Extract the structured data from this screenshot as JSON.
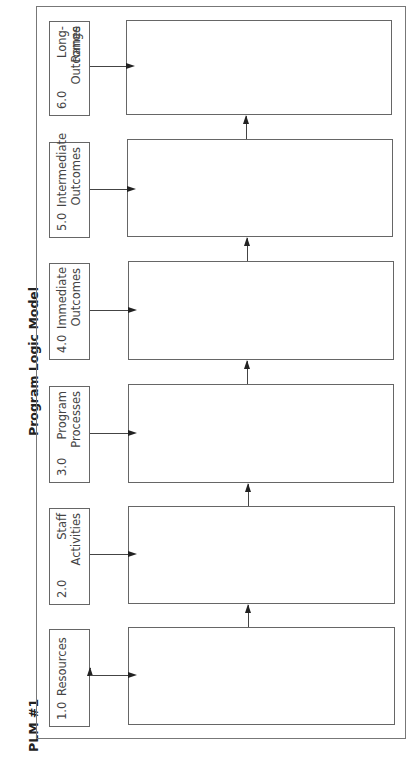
{
  "diagram": {
    "id_label": "PLM #1",
    "title": "Program Logic Model",
    "orientation": "rotated 90° counter-clockwise",
    "stages": [
      {
        "number": "1.0",
        "name": "Resources",
        "line1": "Resources",
        "line2": ""
      },
      {
        "number": "2.0",
        "name": "Staff Activities",
        "line1": "Staff",
        "line2": "Activities"
      },
      {
        "number": "3.0",
        "name": "Program Processes",
        "line1": "Program",
        "line2": "Processes"
      },
      {
        "number": "4.0",
        "name": "Immediate Outcomes",
        "line1": "Immediate",
        "line2": "Outcomes"
      },
      {
        "number": "5.0",
        "name": "Intermediate Outcomes",
        "line1": "Intermediate",
        "line2": "Outcomes"
      },
      {
        "number": "6.0",
        "name": "Long-Range Outcomes",
        "line1": "Long-Range",
        "line2": "Outcomes"
      }
    ],
    "connections": [
      {
        "from": "1.0",
        "to": "2.0"
      },
      {
        "from": "2.0",
        "to": "3.0"
      },
      {
        "from": "3.0",
        "to": "4.0"
      },
      {
        "from": "4.0",
        "to": "5.0"
      },
      {
        "from": "5.0",
        "to": "6.0"
      }
    ],
    "colors": {
      "line": "#666666",
      "text": "#333333",
      "background": "#ffffff"
    }
  }
}
